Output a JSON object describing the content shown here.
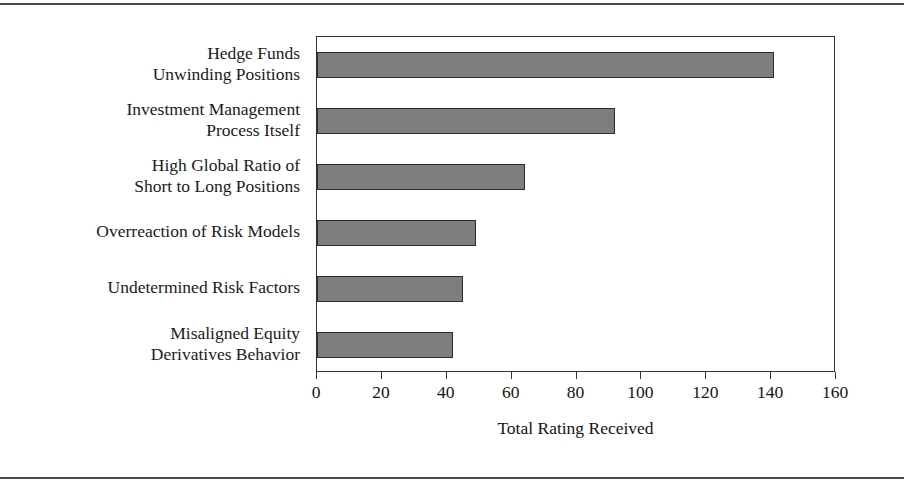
{
  "chart_data": {
    "type": "bar",
    "orientation": "horizontal",
    "title": "",
    "xlabel": "Total Rating Received",
    "ylabel": "",
    "xlim": [
      0,
      160
    ],
    "grid": false,
    "legend": null,
    "bar_color": "#7d7d7d",
    "bar_edge_color": "#2b2b2b",
    "xticks": [
      0,
      20,
      40,
      60,
      80,
      100,
      120,
      140,
      160
    ],
    "xtick_labels": [
      "0",
      "20",
      "40",
      "60",
      "80",
      "100",
      "120",
      "140",
      "160"
    ],
    "categories": [
      "Hedge Funds\nUnwinding Positions",
      "Investment Management\nProcess Itself",
      "High Global Ratio of\nShort to Long Positions",
      "Overreaction of Risk Models",
      "Undetermined Risk Factors",
      "Misaligned Equity\nDerivatives Behavior"
    ],
    "values": [
      141,
      92,
      64,
      49,
      45,
      42
    ]
  }
}
